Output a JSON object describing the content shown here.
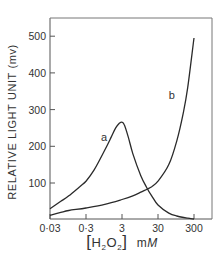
{
  "chart_data": {
    "type": "line",
    "title": "",
    "xlabel": "[H2O2]  mM",
    "xlabel_parts": {
      "open": "[",
      "h": "H",
      "sub1": "2",
      "o": "O",
      "sub2": "2",
      "close": "]",
      "unit_m": "m",
      "unit_M": "M"
    },
    "ylabel": "RELATIVE LIGHT UNIT (mv)",
    "x_scale": "log",
    "xlim": [
      0.03,
      500
    ],
    "ylim": [
      0,
      545
    ],
    "x_ticks": [
      0.03,
      0.3,
      3,
      30,
      300
    ],
    "x_tick_labels": [
      "0·03",
      "0·3",
      "3",
      "30",
      "300"
    ],
    "y_ticks": [
      100,
      200,
      300,
      400,
      500
    ],
    "y_tick_labels": [
      "100",
      "200",
      "300",
      "400",
      "500"
    ],
    "grid": false,
    "legend": "none (inline curve labels)",
    "series": [
      {
        "name": "a",
        "x": [
          0.03,
          0.06,
          0.1,
          0.2,
          0.3,
          0.5,
          1,
          1.5,
          2,
          2.5,
          3,
          3.5,
          4.5,
          6,
          10,
          15,
          20,
          30,
          60,
          100,
          200,
          300
        ],
        "y": [
          30,
          50,
          65,
          90,
          105,
          135,
          190,
          225,
          250,
          262,
          266,
          258,
          225,
          180,
          120,
          85,
          65,
          40,
          18,
          10,
          4,
          2
        ]
      },
      {
        "name": "b",
        "x": [
          0.03,
          0.06,
          0.1,
          0.3,
          1,
          3,
          6,
          10,
          20,
          30,
          60,
          100,
          150,
          200,
          300
        ],
        "y": [
          12,
          20,
          25,
          32,
          42,
          55,
          65,
          75,
          90,
          105,
          150,
          215,
          290,
          360,
          495
        ]
      }
    ],
    "annotations": [
      {
        "text": "a",
        "x": 1.3,
        "y": 225
      },
      {
        "text": "b",
        "x": 100,
        "y": 340
      }
    ]
  }
}
